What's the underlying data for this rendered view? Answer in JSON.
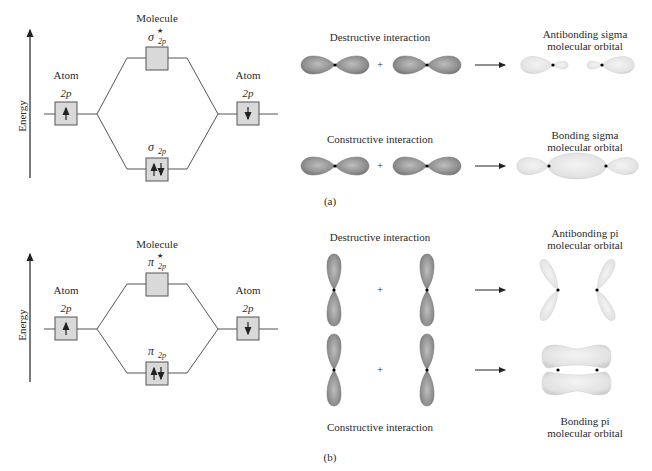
{
  "panel_a": {
    "caption": "(a)",
    "energy_label": "Energy",
    "molecule_label": "Molecule",
    "left_atom": {
      "label": "Atom",
      "orbital": "2p",
      "electrons": "up"
    },
    "right_atom": {
      "label": "Atom",
      "orbital": "2p",
      "electrons": "down"
    },
    "antibonding_mo": {
      "symbol": "σ",
      "subscript": "2p",
      "star": "★",
      "electrons": "none"
    },
    "bonding_mo": {
      "symbol": "σ",
      "subscript": "2p",
      "electrons": "up-down"
    },
    "destructive_label": "Destructive interaction",
    "constructive_label": "Constructive interaction",
    "plus": "+",
    "antibonding_result_line1": "Antibonding sigma",
    "antibonding_result_line2": "molecular orbital",
    "bonding_result_line1": "Bonding sigma",
    "bonding_result_line2": "molecular orbital"
  },
  "panel_b": {
    "caption": "(b)",
    "energy_label": "Energy",
    "molecule_label": "Molecule",
    "left_atom": {
      "label": "Atom",
      "orbital": "2p",
      "electrons": "up"
    },
    "right_atom": {
      "label": "Atom",
      "orbital": "2p",
      "electrons": "down"
    },
    "antibonding_mo": {
      "symbol": "π",
      "subscript": "2p",
      "star": "★",
      "electrons": "none"
    },
    "bonding_mo": {
      "symbol": "π",
      "subscript": "2p",
      "electrons": "up-down"
    },
    "destructive_label": "Destructive interaction",
    "constructive_label": "Constructive interaction",
    "plus": "+",
    "antibonding_result_line1": "Antibonding pi",
    "antibonding_result_line2": "molecular orbital",
    "bonding_result_line1": "Bonding pi",
    "bonding_result_line2": "molecular orbital"
  },
  "colors": {
    "line": "#555555",
    "box_fill": "#d9d9d9",
    "atomic_orbital": "#8e8e8e",
    "molecular_orbital": "#e6e6e6",
    "text": "#2a2a2a"
  }
}
